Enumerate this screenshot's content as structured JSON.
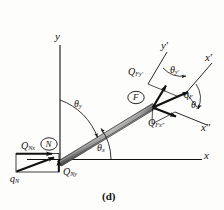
{
  "figure": {
    "caption": "(d)",
    "colors": {
      "line": "#1a1a1a",
      "beam_fill": "#8d8d8d",
      "beam_edge_dark": "#4a4a4a",
      "beam_highlight": "#b9b9b9",
      "background": "#fdfdfc",
      "text": "#111111"
    }
  },
  "global_axes": {
    "y_label": "y",
    "x_label": "x",
    "origin_note": "N"
  },
  "local_axes": {
    "y_prime_label": "y'",
    "x_prime_label": "x'",
    "x_double_prime_label": "x\""
  },
  "nodes": [
    {
      "name": "node-n",
      "label": "N"
    },
    {
      "name": "node-f",
      "label": "F"
    }
  ],
  "forces": {
    "q_n": {
      "symbol": "q",
      "sub": "N"
    },
    "q_nx": {
      "symbol": "Q",
      "sub": "Nx"
    },
    "q_ny": {
      "symbol": "Q",
      "sub": "Ny"
    },
    "q_f": {
      "symbol": "q",
      "sub": "F"
    },
    "q_fy_prime": {
      "symbol": "Q",
      "sub": "Fy'"
    },
    "q_fx_double_prime": {
      "symbol": "Q",
      "sub": "Fx\""
    }
  },
  "angles": {
    "theta_y": {
      "symbol": "θ",
      "sub": "y"
    },
    "theta_x": {
      "symbol": "θ",
      "sub": "x"
    },
    "theta_y_prime": {
      "symbol": "θ",
      "sub": "y'"
    },
    "theta_x_double_prime": {
      "symbol": "θ",
      "sub": "x\""
    }
  }
}
